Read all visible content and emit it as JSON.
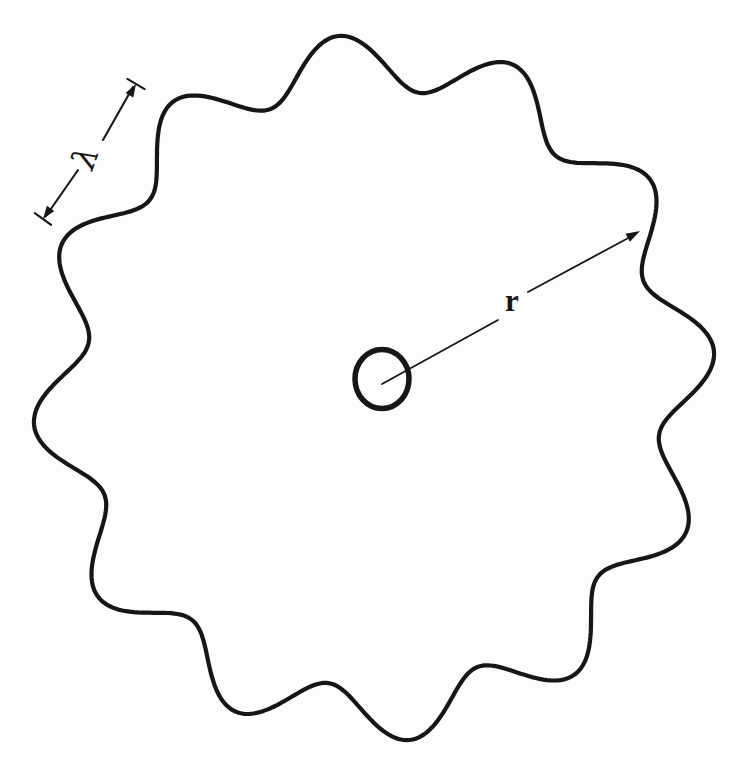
{
  "figure": {
    "background_color": "#fdfdfd",
    "ink_color": "#161616",
    "canvas": {
      "width": 745,
      "height": 761
    },
    "orbit_wave": {
      "cx": 374,
      "cy": 388,
      "mean_radius": 320,
      "ripple_amplitude": 27,
      "ripple_count": 12,
      "phase_deg": 6,
      "x_scale": 0.985,
      "y_scale": 1.02,
      "stroke_width": 4.2
    },
    "nucleus": {
      "cx": 382,
      "cy": 379,
      "rx": 27,
      "ry": 29.5,
      "stroke_width": 5.5
    },
    "radius_arrow": {
      "label": "r",
      "label_x": 512,
      "label_y": 302,
      "segments": [
        [
          [
            382,
            384
          ],
          [
            498,
            320
          ]
        ],
        [
          [
            528,
            292
          ],
          [
            632,
            236
          ]
        ]
      ],
      "tip": [
        640,
        231
      ],
      "head_length": 14,
      "head_half_width": 4.5,
      "stroke_width": 1.8
    },
    "wavelength_dimension": {
      "label": "λ",
      "label_x": 85,
      "label_y": 158,
      "segments": [
        [
          [
            103,
            140
          ],
          [
            133,
            87
          ]
        ],
        [
          [
            78,
            170
          ],
          [
            46,
            216
          ]
        ]
      ],
      "tips": [
        [
          136,
          84
        ],
        [
          43,
          219
        ]
      ],
      "tick_half_length": 10,
      "head_length": 13,
      "head_half_width": 4.5,
      "stroke_width": 2.1
    }
  }
}
